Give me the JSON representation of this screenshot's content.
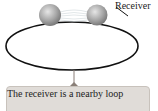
{
  "diagram": {
    "labels": {
      "receiver": "Receiver"
    },
    "callout": {
      "text": "The receiver is a nearby loop"
    },
    "colors": {
      "loop": "#111111",
      "sphere": "#a8a8a8",
      "callout_bg": "#e0dcd8",
      "pointer": "#8a7f78"
    }
  }
}
